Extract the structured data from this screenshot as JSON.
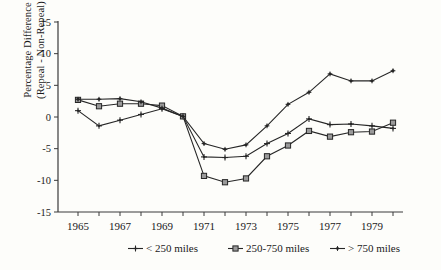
{
  "figure": {
    "background": "#fdfdfa",
    "line_color": "#262626",
    "axis_color": "#3a3a3a"
  },
  "axes": {
    "y_label_line1": "Percentage Difference",
    "y_label_line2": "(Repeal - Non-Repeal)",
    "y_ticks": [
      "15",
      "10",
      "5",
      "0",
      "-5",
      "-10",
      "-15"
    ],
    "x_ticks_labeled": [
      "1965",
      "1967",
      "1969",
      "1971",
      "1973",
      "1975",
      "1977",
      "1979"
    ]
  },
  "legend": {
    "items": [
      {
        "label": "< 250 miles",
        "marker": "plus"
      },
      {
        "label": "250-750 miles",
        "marker": "square"
      },
      {
        "label": "> 750 miles",
        "marker": "plus-small"
      }
    ]
  },
  "chart_data": {
    "type": "line",
    "title": "",
    "xlabel": "",
    "ylabel": "Percentage Difference (Repeal - Non-Repeal)",
    "xlim": [
      1965,
      1980
    ],
    "ylim": [
      -15,
      15
    ],
    "grid": false,
    "legend_position": "bottom",
    "x": [
      1965,
      1966,
      1967,
      1968,
      1969,
      1970,
      1971,
      1972,
      1973,
      1974,
      1975,
      1976,
      1977,
      1978,
      1979,
      1980
    ],
    "series": [
      {
        "name": "< 250 miles",
        "marker": "plus",
        "values": [
          1.0,
          -1.4,
          -0.5,
          0.4,
          1.3,
          0.1,
          -6.3,
          -6.4,
          -6.2,
          -4.2,
          -2.6,
          -0.3,
          -1.2,
          -1.1,
          -1.4,
          -1.8
        ]
      },
      {
        "name": "250-750 miles",
        "marker": "square",
        "values": [
          2.7,
          1.7,
          2.1,
          2.1,
          1.8,
          0.1,
          -9.3,
          -10.3,
          -9.7,
          -6.2,
          -4.5,
          -2.2,
          -3.1,
          -2.4,
          -2.3,
          -0.9
        ]
      },
      {
        "name": "> 750 miles",
        "marker": "plus-small",
        "values": [
          2.8,
          2.8,
          2.9,
          2.4,
          1.4,
          0.1,
          -4.2,
          -5.1,
          -4.4,
          -1.4,
          2.0,
          3.9,
          6.8,
          5.7,
          5.7,
          7.3
        ]
      }
    ]
  }
}
